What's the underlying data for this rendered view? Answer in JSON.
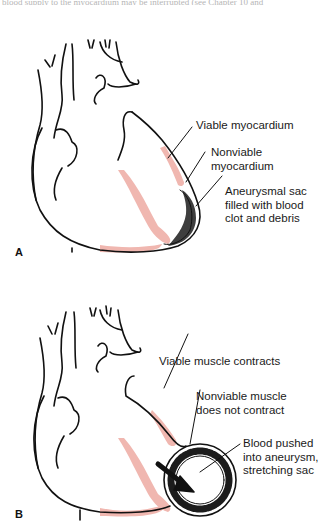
{
  "top_cropped_text": "blood supply to the myocardium may be interrupted (see Chapter 10 and",
  "colors": {
    "outline": "#111111",
    "viable_tissue": "#f0b7b0",
    "clot": "#1c1c1c",
    "background": "#ffffff"
  },
  "panels": [
    {
      "letter": "A",
      "labels": [
        {
          "text": "Viable myocardium"
        },
        {
          "text": "Nonviable\nmyocardium",
          "lines": [
            "Nonviable",
            "myocardium"
          ]
        },
        {
          "text": "Aneurysmal sac filled with blood clot and debris",
          "lines": [
            "Aneurysmal sac",
            "filled with blood",
            "clot and debris"
          ]
        }
      ]
    },
    {
      "letter": "B",
      "labels": [
        {
          "text": "Viable muscle contracts"
        },
        {
          "text": "Nonviable muscle does not contract",
          "lines": [
            "Nonviable muscle",
            "does not contract"
          ]
        },
        {
          "text": "Blood pushed into aneurysm, stretching sac",
          "lines": [
            "Blood pushed",
            "into aneurysm,",
            "stretching sac"
          ]
        }
      ]
    }
  ],
  "icons": {
    "arrow": "blood-flow-arrow-icon"
  }
}
